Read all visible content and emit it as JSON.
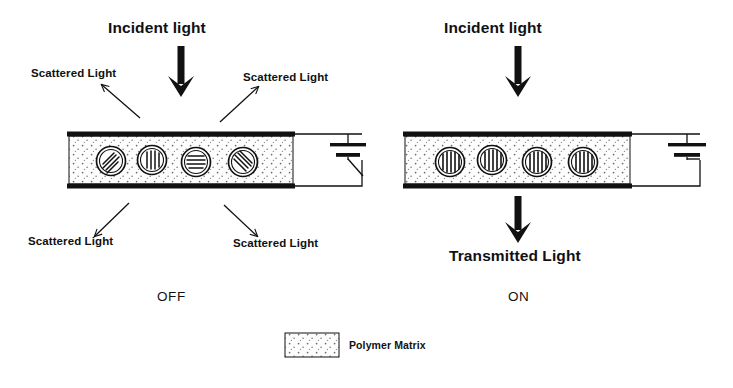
{
  "figure": {
    "kind": "pdlc-device-schematic",
    "background": "#ffffff",
    "ink": "#111111",
    "matrix_fill": "#fdfdfd",
    "matrix_dots": "#6b6b6b"
  },
  "panels": [
    {
      "id": "off",
      "state_label": "OFF",
      "incident_label": "Incident light",
      "cell": {
        "x": 67,
        "y": 133,
        "w": 228,
        "h": 54
      },
      "state_label_pos": {
        "x": 157,
        "y": 291
      },
      "incident_arrow": {
        "x": 181,
        "y": 48,
        "length": 48
      },
      "incident_label_pos": {
        "x": 108,
        "y": 22
      },
      "droplets": [
        {
          "cx": 111,
          "cy": 161,
          "r": 14,
          "orientation": "diagonal-45",
          "lines": 4
        },
        {
          "cx": 152,
          "cy": 160,
          "r": 14,
          "orientation": "vertical",
          "lines": 4
        },
        {
          "cx": 196,
          "cy": 162,
          "r": 14,
          "orientation": "horizontal",
          "lines": 4
        },
        {
          "cx": 243,
          "cy": 162,
          "r": 14,
          "orientation": "diagonal-135",
          "lines": 4
        }
      ],
      "scattered_labels": [
        {
          "text": "Scattered Light",
          "x": 31,
          "y": 69,
          "arrow": {
            "x1": 140,
            "y1": 118,
            "x2": 101,
            "y2": 84
          }
        },
        {
          "text": "Scattered Light",
          "x": 243,
          "y": 73,
          "arrow": {
            "x1": 220,
            "y1": 122,
            "x2": 259,
            "y2": 86
          }
        },
        {
          "text": "Scattered Light",
          "x": 28,
          "y": 238,
          "arrow": {
            "x1": 129,
            "y1": 203,
            "x2": 94,
            "y2": 237
          }
        },
        {
          "text": "Scattered Light",
          "x": 233,
          "y": 240,
          "arrow": {
            "x1": 224,
            "y1": 205,
            "x2": 258,
            "y2": 237
          }
        }
      ],
      "circuit": {
        "switch": "open",
        "battery": "dc-source"
      },
      "transmitted_label": null
    },
    {
      "id": "on",
      "state_label": "ON",
      "incident_label": "Incident light",
      "cell": {
        "x": 403,
        "y": 133,
        "w": 229,
        "h": 54
      },
      "state_label_pos": {
        "x": 508,
        "y": 291
      },
      "incident_arrow": {
        "x": 518,
        "y": 48,
        "length": 48
      },
      "incident_label_pos": {
        "x": 444,
        "y": 22
      },
      "droplets": [
        {
          "cx": 450,
          "cy": 162,
          "r": 14,
          "orientation": "vertical",
          "lines": 5
        },
        {
          "cx": 492,
          "cy": 160,
          "r": 14,
          "orientation": "vertical",
          "lines": 5
        },
        {
          "cx": 537,
          "cy": 162,
          "r": 14,
          "orientation": "vertical",
          "lines": 5
        },
        {
          "cx": 583,
          "cy": 162,
          "r": 14,
          "orientation": "vertical",
          "lines": 5
        }
      ],
      "scattered_labels": [],
      "circuit": {
        "switch": "closed",
        "battery": "dc-source"
      },
      "transmitted_label": {
        "text": "Transmitted Light",
        "x": 450,
        "y": 250
      },
      "transmitted_arrow": {
        "x": 518,
        "y": 197,
        "length": 44
      }
    }
  ],
  "legend": {
    "swatch": {
      "x": 285,
      "y": 333,
      "w": 54,
      "h": 24
    },
    "label": "Polymer Matrix",
    "label_pos": {
      "x": 349,
      "y": 340
    }
  }
}
